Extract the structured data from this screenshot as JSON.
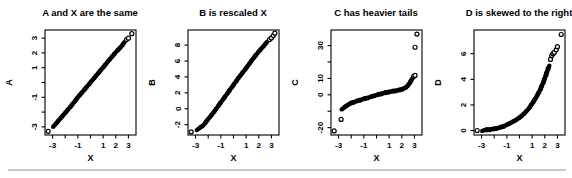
{
  "page": {
    "background": "#ffffff",
    "divider_color": "#c9c9c9",
    "point_color": "#000000",
    "axis_color": "#000000"
  },
  "chart_data": {
    "type": "scatter",
    "grid": "off",
    "legend": "none",
    "panels": [
      {
        "title": "A and X are the same",
        "xlabel": "X",
        "ylabel": "A",
        "xlim": [
          -3.6,
          3.6
        ],
        "ylim": [
          -3.55,
          3.55
        ],
        "xticks": [
          -3,
          -2,
          -1,
          0,
          1,
          2,
          3
        ],
        "xtick_labels": [
          "-3",
          "",
          "-1",
          "",
          "1",
          "2",
          "3"
        ],
        "yticks": [
          -3,
          -2,
          -1,
          0,
          1,
          2,
          3
        ],
        "ytick_labels": [
          "-3",
          "",
          "-1",
          "",
          "1",
          "2",
          "3"
        ],
        "band": [
          [
            -2.9,
            -2.95
          ],
          [
            -2.4,
            -2.45
          ],
          [
            -2.0,
            -2.05
          ],
          [
            -1.5,
            -1.55
          ],
          [
            -1.0,
            -1.0
          ],
          [
            -0.5,
            -0.5
          ],
          [
            0.0,
            0.0
          ],
          [
            0.5,
            0.52
          ],
          [
            1.0,
            1.02
          ],
          [
            1.5,
            1.55
          ],
          [
            2.0,
            2.05
          ],
          [
            2.4,
            2.4
          ],
          [
            2.75,
            2.8
          ]
        ],
        "points": [
          [
            -3.35,
            -3.3
          ],
          [
            2.85,
            2.9
          ],
          [
            3.0,
            3.0
          ],
          [
            3.27,
            3.3
          ]
        ]
      },
      {
        "title": "B is rescaled X",
        "xlabel": "X",
        "ylabel": "B",
        "xlim": [
          -3.6,
          3.6
        ],
        "ylim": [
          -3.3,
          9.9
        ],
        "xticks": [
          -3,
          -2,
          -1,
          0,
          1,
          2,
          3
        ],
        "xtick_labels": [
          "-3",
          "",
          "-1",
          "",
          "1",
          "2",
          "3"
        ],
        "yticks": [
          -2,
          0,
          2,
          4,
          6,
          8
        ],
        "ytick_labels": [
          "-2",
          "0",
          "2",
          "4",
          "6",
          "8"
        ],
        "band": [
          [
            -2.85,
            -2.6
          ],
          [
            -2.4,
            -2.1
          ],
          [
            -2.0,
            -1.3
          ],
          [
            -1.5,
            -0.3
          ],
          [
            -1.0,
            0.8
          ],
          [
            -0.5,
            1.9
          ],
          [
            0.0,
            3.0
          ],
          [
            0.5,
            4.1
          ],
          [
            1.0,
            5.1
          ],
          [
            1.5,
            6.2
          ],
          [
            2.0,
            7.2
          ],
          [
            2.4,
            7.9
          ],
          [
            2.7,
            8.5
          ]
        ],
        "points": [
          [
            -3.35,
            -2.9
          ],
          [
            2.85,
            8.7
          ],
          [
            3.0,
            8.9
          ],
          [
            3.15,
            9.2
          ],
          [
            3.27,
            9.5
          ]
        ]
      },
      {
        "title": "C has heavier tails",
        "xlabel": "X",
        "ylabel": "C",
        "xlim": [
          -3.6,
          3.6
        ],
        "ylim": [
          -24.5,
          39.5
        ],
        "xticks": [
          -3,
          -2,
          -1,
          0,
          1,
          2,
          3
        ],
        "xtick_labels": [
          "-3",
          "",
          "-1",
          "",
          "1",
          "2",
          "3"
        ],
        "yticks": [
          -20,
          -10,
          0,
          10,
          20,
          30
        ],
        "ytick_labels": [
          "-20",
          "",
          "0",
          "10",
          "",
          "30"
        ],
        "band": [
          [
            -2.7,
            -8.5
          ],
          [
            -2.45,
            -7.2
          ],
          [
            -2.2,
            -5.8
          ],
          [
            -2.0,
            -5.0
          ],
          [
            -1.7,
            -4.2
          ],
          [
            -1.4,
            -3.4
          ],
          [
            -1.0,
            -2.5
          ],
          [
            -0.6,
            -1.6
          ],
          [
            -0.2,
            -0.6
          ],
          [
            0.2,
            0.3
          ],
          [
            0.6,
            1.1
          ],
          [
            1.0,
            1.8
          ],
          [
            1.4,
            2.3
          ],
          [
            1.8,
            2.9
          ],
          [
            2.1,
            3.6
          ],
          [
            2.35,
            4.6
          ],
          [
            2.5,
            5.8
          ],
          [
            2.65,
            7.5
          ],
          [
            2.8,
            9.5
          ],
          [
            2.9,
            10.8
          ]
        ],
        "points": [
          [
            -3.35,
            -22.0
          ],
          [
            -2.8,
            -15.0
          ],
          [
            2.95,
            11.3
          ],
          [
            3.05,
            11.8
          ],
          [
            3.05,
            29.0
          ],
          [
            3.2,
            37.0
          ]
        ]
      },
      {
        "title": "D is skewed to the right",
        "xlabel": "X",
        "ylabel": "D",
        "xlim": [
          -3.6,
          3.6
        ],
        "ylim": [
          -0.35,
          7.85
        ],
        "xticks": [
          -3,
          -2,
          -1,
          0,
          1,
          2,
          3
        ],
        "xtick_labels": [
          "-3",
          "",
          "-1",
          "",
          "1",
          "2",
          "3"
        ],
        "yticks": [
          0,
          2,
          4,
          6
        ],
        "ytick_labels": [
          "0",
          "2",
          "4",
          "6"
        ],
        "band": [
          [
            -2.9,
            0.02
          ],
          [
            -2.4,
            0.07
          ],
          [
            -2.0,
            0.13
          ],
          [
            -1.6,
            0.22
          ],
          [
            -1.2,
            0.35
          ],
          [
            -0.8,
            0.55
          ],
          [
            -0.4,
            0.75
          ],
          [
            0.0,
            1.0
          ],
          [
            0.4,
            1.35
          ],
          [
            0.8,
            1.8
          ],
          [
            1.2,
            2.4
          ],
          [
            1.6,
            3.1
          ],
          [
            1.9,
            3.8
          ],
          [
            2.15,
            4.5
          ],
          [
            2.35,
            5.1
          ]
        ],
        "points": [
          [
            -3.35,
            0.0
          ],
          [
            2.45,
            5.55
          ],
          [
            2.55,
            5.85
          ],
          [
            2.65,
            6.0
          ],
          [
            2.75,
            6.1
          ],
          [
            2.9,
            6.3
          ],
          [
            3.0,
            6.55
          ],
          [
            3.3,
            7.5
          ]
        ]
      }
    ]
  }
}
